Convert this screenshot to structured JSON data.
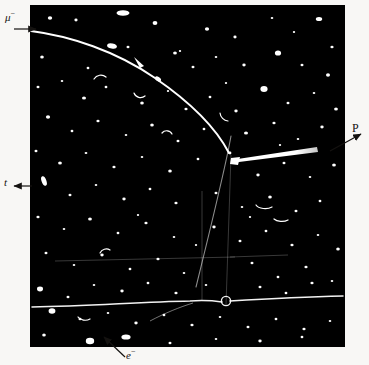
{
  "figure": {
    "kind": "bubble-chamber-photograph",
    "background_color": "#f8f7f5",
    "photo_color": "#000000",
    "track_color": "#ffffff",
    "photo_rect": {
      "x": 30,
      "y": 5,
      "width": 315,
      "height": 342
    }
  },
  "labels": {
    "muon": {
      "text": "μ",
      "charge": "−",
      "x": 5,
      "y": 10
    },
    "tau": {
      "text": "t",
      "x": 4,
      "y": 177
    },
    "proton": {
      "text": "P",
      "x": 352,
      "y": 122
    },
    "electron": {
      "text": "e",
      "charge": "−",
      "x": 126,
      "y": 348
    }
  },
  "annotations": {
    "muon_arrow": {
      "from_x": 14,
      "from_y": 28,
      "to_x": 34,
      "to_y": 28,
      "direction": "right"
    },
    "tau_arrow": {
      "from_x": 30,
      "from_y": 186,
      "to_x": 14,
      "to_y": 186,
      "direction": "left"
    },
    "proton_arrow": {
      "from_x": 330,
      "from_y": 150,
      "to_x": 360,
      "to_y": 134,
      "direction": "up-right"
    },
    "electron_arrow": {
      "from_x": 124,
      "from_y": 356,
      "to_x": 104,
      "to_y": 338,
      "direction": "up-left"
    }
  },
  "tracks": {
    "muon_track": {
      "name": "muon-track",
      "description": "long curving bright track entering at upper left and bending down to the vertex",
      "entry": {
        "x": 31,
        "y": 31
      },
      "vertex": {
        "x": 232,
        "y": 158
      }
    },
    "proton_track": {
      "name": "proton-track",
      "description": "short thick bright track from vertex toward the right",
      "start": {
        "x": 232,
        "y": 158
      },
      "end": {
        "x": 318,
        "y": 150
      },
      "max_width_px": 5
    },
    "secondary_track": {
      "name": "secondary-faint-track",
      "description": "faint track continuing down-left from the vertex",
      "start": {
        "x": 231,
        "y": 160
      },
      "end": {
        "x": 196,
        "y": 305
      }
    },
    "electron_track": {
      "name": "electron-track",
      "description": "long near-horizontal track with a small spiral loop crossing the lower part of the frame",
      "start": {
        "x": 32,
        "y": 306
      },
      "end": {
        "x": 344,
        "y": 296
      },
      "loop": {
        "x": 195,
        "y": 300,
        "radius": 5
      }
    },
    "fiducial_marks": {
      "name": "fiducial-marks",
      "description": "faint straight reference lines in the lower middle of the chamber"
    }
  },
  "noise": {
    "description": "scattered white bubble specks across the dark chamber field",
    "speck_count": 210
  }
}
